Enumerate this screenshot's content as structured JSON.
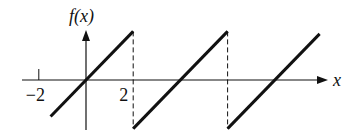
{
  "chart_data": {
    "type": "line",
    "title": "",
    "ylabel": "f(x)",
    "xlabel": "x",
    "xlim": [
      -3.6,
      11.2
    ],
    "ylim": [
      -2.1,
      2.1
    ],
    "tick_labels": [
      {
        "x": -2,
        "label": "−2"
      },
      {
        "x": 2,
        "label": "2"
      }
    ],
    "period": 4,
    "series": [
      {
        "name": "segment-1",
        "points": [
          [
            -1.5,
            -1.5
          ],
          [
            2,
            2
          ]
        ]
      },
      {
        "name": "segment-2",
        "points": [
          [
            2,
            -2
          ],
          [
            6,
            2
          ]
        ]
      },
      {
        "name": "segment-3",
        "points": [
          [
            6,
            -2
          ],
          [
            9.9,
            1.9
          ]
        ]
      }
    ],
    "dashed_verticals": [
      {
        "x": 2,
        "from": 2,
        "to": -2
      },
      {
        "x": 6,
        "from": 2,
        "to": -2
      }
    ],
    "grid": false,
    "legend": "none"
  }
}
